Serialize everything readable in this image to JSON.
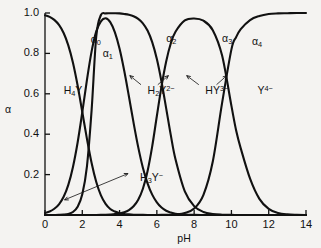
{
  "figure": {
    "name": "edta-speciation-diagram",
    "background_color": "#f4f3f1",
    "line_color": "#111111",
    "axis_label_y": "α",
    "axis_label_x": "pH"
  },
  "chart_data": {
    "type": "line",
    "title": "",
    "subtitle": "",
    "xlabel": "pH",
    "ylabel": "α",
    "xlim": [
      0,
      14
    ],
    "ylim": [
      0,
      1.0
    ],
    "grid": false,
    "legend": "inline-annotations",
    "xticks": [
      "0",
      "2",
      "4",
      "6",
      "8",
      "10",
      "12",
      "14"
    ],
    "xtick_values": [
      0,
      2,
      4,
      6,
      8,
      10,
      12,
      14
    ],
    "yticks": [
      "0.2",
      "0.4",
      "0.6",
      "0.8",
      "1.0"
    ],
    "ytick_values": [
      0.2,
      0.4,
      0.6,
      0.8,
      1.0
    ],
    "pka_values": [
      2.0,
      2.67,
      6.16,
      10.26
    ],
    "x": [
      0,
      0.25,
      0.5,
      0.75,
      1,
      1.25,
      1.5,
      1.75,
      2,
      2.25,
      2.5,
      2.75,
      3,
      3.25,
      3.5,
      3.75,
      4,
      4.25,
      4.5,
      4.75,
      5,
      5.25,
      5.5,
      5.75,
      6,
      6.25,
      6.5,
      6.75,
      7,
      7.5,
      8,
      8.5,
      9,
      9.5,
      10,
      10.25,
      10.5,
      11,
      11.5,
      12,
      12.5,
      13,
      13.5,
      14
    ],
    "series": [
      {
        "name": "α₀",
        "formula": "H4Y",
        "formula_display": "H₄Y",
        "values": [
          0.989,
          0.981,
          0.966,
          0.941,
          0.901,
          0.84,
          0.754,
          0.641,
          0.51,
          0.377,
          0.257,
          0.163,
          0.097,
          0.055,
          0.03,
          0.017,
          0.009,
          0.005,
          0.003,
          0.0015,
          0.0008,
          0.0004,
          0.0002,
          0.0001,
          6e-05,
          3e-05,
          1e-05,
          5e-06,
          2e-06,
          0,
          0,
          0,
          0,
          0,
          0,
          0,
          0,
          0,
          0,
          0,
          0,
          0,
          0,
          0
        ]
      },
      {
        "name": "α₁",
        "formula": "H3Y-",
        "formula_display": "H₃Y⁻",
        "values": [
          0.01,
          0.017,
          0.031,
          0.053,
          0.09,
          0.149,
          0.238,
          0.359,
          0.509,
          0.669,
          0.81,
          0.909,
          0.959,
          0.974,
          0.955,
          0.904,
          0.823,
          0.714,
          0.588,
          0.457,
          0.336,
          0.234,
          0.157,
          0.101,
          0.063,
          0.037,
          0.021,
          0.012,
          0.006,
          0.002,
          0.0006,
          0.0002,
          6e-05,
          2e-05,
          5e-06,
          3e-06,
          2e-06,
          0,
          0,
          0,
          0,
          0,
          0,
          0
        ]
      },
      {
        "name": "α₂",
        "formula": "H2Y2-",
        "formula_display": "H₂Y²⁻",
        "values": [
          2e-05,
          6e-05,
          0.0002,
          0.0006,
          0.0018,
          0.0053,
          0.015,
          0.041,
          0.103,
          0.241,
          0.519,
          0.885,
          0.99,
          0.998,
          0.999,
          0.999,
          0.998,
          0.995,
          0.991,
          0.984,
          0.971,
          0.949,
          0.913,
          0.856,
          0.772,
          0.66,
          0.528,
          0.394,
          0.276,
          0.117,
          0.044,
          0.015,
          0.005,
          0.0016,
          0.0005,
          0.0003,
          0.00015,
          5e-05,
          2e-05,
          5e-06,
          0,
          0,
          0,
          0
        ]
      },
      {
        "name": "α₃",
        "formula": "HY3-",
        "formula_display": "HY³⁻",
        "values": [
          0,
          0,
          0,
          0,
          0,
          0,
          0,
          0,
          0,
          2e-05,
          8e-05,
          0.0002,
          0.0007,
          0.0014,
          0.0025,
          0.0044,
          0.0078,
          0.0138,
          0.0244,
          0.0431,
          0.0755,
          0.13,
          0.217,
          0.34,
          0.49,
          0.637,
          0.76,
          0.85,
          0.907,
          0.963,
          0.973,
          0.962,
          0.915,
          0.789,
          0.54,
          0.42,
          0.33,
          0.18,
          0.08,
          0.03,
          0.01,
          0.003,
          0.001,
          0.0003
        ]
      },
      {
        "name": "α₄",
        "formula": "Y4-",
        "formula_display": "Y⁴⁻",
        "values": [
          0,
          0,
          0,
          0,
          0,
          0,
          0,
          0,
          0,
          0,
          0,
          0,
          0,
          0,
          0,
          0,
          0,
          0,
          0,
          0,
          0,
          0,
          2e-05,
          5e-05,
          0.00015,
          0.0004,
          0.0008,
          0.0015,
          0.003,
          0.01,
          0.032,
          0.1,
          0.265,
          0.555,
          0.82,
          0.88,
          0.92,
          0.965,
          0.985,
          0.995,
          0.998,
          0.999,
          1.0,
          1.0
        ]
      }
    ],
    "annotations": [
      {
        "label": "α₀",
        "kind": "curve-label",
        "pH": 2.45,
        "alpha": 0.865
      },
      {
        "label": "α₁",
        "kind": "curve-label",
        "pH": 3.1,
        "alpha": 0.795
      },
      {
        "label": "α₂",
        "kind": "curve-label",
        "pH": 6.5,
        "alpha": 0.87
      },
      {
        "label": "α₃",
        "kind": "curve-label",
        "pH": 9.5,
        "alpha": 0.87
      },
      {
        "label": "α₄",
        "kind": "curve-label",
        "pH": 11.1,
        "alpha": 0.855
      },
      {
        "label": "H₄Y",
        "kind": "species-label",
        "pH": 1.0,
        "alpha": 0.615
      },
      {
        "label": "H₃Y⁻",
        "kind": "species-label",
        "pH": 5.1,
        "alpha": 0.185
      },
      {
        "label": "H₂Y²⁻",
        "kind": "species-label",
        "pH": 5.5,
        "alpha": 0.615
      },
      {
        "label": "HY³⁻",
        "kind": "species-label",
        "pH": 8.6,
        "alpha": 0.615
      },
      {
        "label": "Y⁴⁻",
        "kind": "species-label",
        "pH": 11.4,
        "alpha": 0.615
      }
    ]
  }
}
